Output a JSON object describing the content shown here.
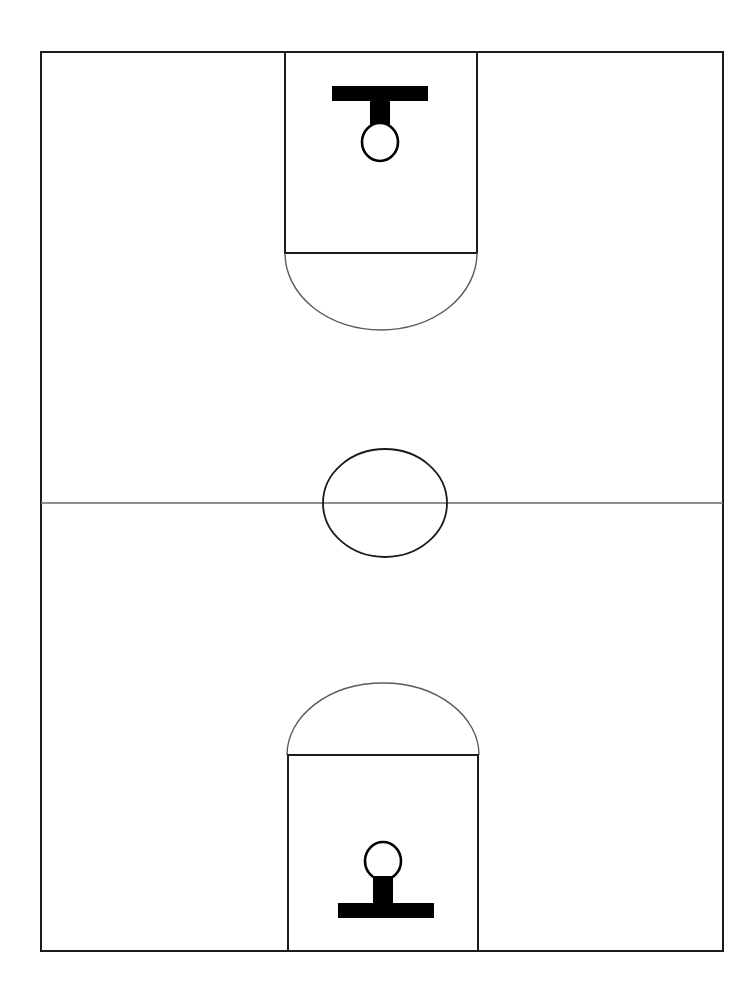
{
  "diagram": {
    "orientation": "vertical",
    "background_color": "#ffffff",
    "line_color": "#1a1a1a",
    "arc_color": "#5a5a5a",
    "hoop_color": "#000000"
  },
  "chart_data": {
    "type": "diagram",
    "subtitle": "",
    "canvas": {
      "width": 740,
      "height": 1002
    },
    "elements": [
      {
        "name": "court-boundary",
        "shape": "rectangle",
        "x": 41,
        "y": 52,
        "width": 682,
        "height": 899,
        "stroke": "#1a1a1a",
        "stroke_width": 2,
        "fill": "none"
      },
      {
        "name": "halfway-line",
        "shape": "line",
        "x1": 41,
        "y1": 503,
        "x2": 723,
        "y2": 503,
        "stroke": "#6a6a6a",
        "stroke_width": 1.6
      },
      {
        "name": "center-circle",
        "shape": "ellipse",
        "cx": 385,
        "cy": 503,
        "rx": 62,
        "ry": 54,
        "stroke": "#1a1a1a",
        "stroke_width": 1.8,
        "fill": "none"
      },
      {
        "name": "top-key-rectangle",
        "shape": "rectangle",
        "x": 285,
        "y": 52,
        "width": 192,
        "height": 201,
        "stroke": "#1a1a1a",
        "stroke_width": 2,
        "fill": "none"
      },
      {
        "name": "top-free-throw-arc",
        "shape": "arc",
        "cx": 381,
        "cy": 253,
        "rx": 96,
        "ry": 77,
        "direction": "downward",
        "stroke": "#5a5a5a",
        "stroke_width": 1.4,
        "fill": "none"
      },
      {
        "name": "top-backboard",
        "shape": "rectangle",
        "x": 332,
        "y": 86,
        "width": 96,
        "height": 15,
        "fill": "#000000"
      },
      {
        "name": "top-hoop-stem",
        "shape": "rectangle",
        "x": 370,
        "y": 101,
        "width": 20,
        "height": 28,
        "fill": "#000000"
      },
      {
        "name": "top-hoop-circle",
        "shape": "ellipse",
        "cx": 380,
        "cy": 142,
        "rx": 18,
        "ry": 19,
        "stroke": "#000000",
        "stroke_width": 2.6,
        "fill": "#ffffff"
      },
      {
        "name": "bottom-key-rectangle",
        "shape": "rectangle",
        "x": 288,
        "y": 755,
        "width": 190,
        "height": 196,
        "stroke": "#1a1a1a",
        "stroke_width": 2,
        "fill": "none"
      },
      {
        "name": "bottom-free-throw-arc",
        "shape": "arc",
        "cx": 383,
        "cy": 755,
        "rx": 96,
        "ry": 72,
        "direction": "upward",
        "stroke": "#5a5a5a",
        "stroke_width": 1.4,
        "fill": "none"
      },
      {
        "name": "bottom-backboard",
        "shape": "rectangle",
        "x": 338,
        "y": 903,
        "width": 96,
        "height": 15,
        "fill": "#000000"
      },
      {
        "name": "bottom-hoop-stem",
        "shape": "rectangle",
        "x": 373,
        "y": 876,
        "width": 20,
        "height": 28,
        "fill": "#000000"
      },
      {
        "name": "bottom-hoop-circle",
        "shape": "ellipse",
        "cx": 383,
        "cy": 861,
        "rx": 18,
        "ry": 19,
        "stroke": "#000000",
        "stroke_width": 2.6,
        "fill": "#ffffff"
      }
    ],
    "labels": [],
    "annotations": []
  }
}
